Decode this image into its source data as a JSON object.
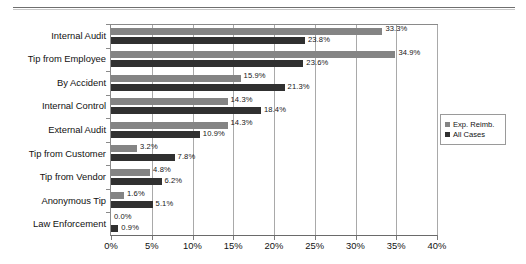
{
  "chart_data": {
    "type": "bar",
    "orientation": "horizontal",
    "title": "",
    "xlabel": "",
    "ylabel": "",
    "xlim": [
      0,
      40
    ],
    "xticks": [
      "0%",
      "5%",
      "10%",
      "15%",
      "20%",
      "25%",
      "30%",
      "35%",
      "40%"
    ],
    "xtick_values": [
      0,
      5,
      10,
      15,
      20,
      25,
      30,
      35,
      40
    ],
    "grid": true,
    "legend_position": "right",
    "categories": [
      "Internal Audit",
      "Tip from Employee",
      "By Accident",
      "Internal Control",
      "External Audit",
      "Tip from Customer",
      "Tip from Vendor",
      "Anonymous Tip",
      "Law Enforcement"
    ],
    "series": [
      {
        "name": "Exp. Reimb.",
        "color": "#848484",
        "values": [
          33.3,
          34.9,
          15.9,
          14.3,
          14.3,
          3.2,
          4.8,
          1.6,
          0.0
        ],
        "labels": [
          "33.3%",
          "34.9%",
          "15.9%",
          "14.3%",
          "14.3%",
          "3.2%",
          "4.8%",
          "1.6%",
          "0.0%"
        ]
      },
      {
        "name": "All Cases",
        "color": "#303030",
        "values": [
          23.8,
          23.6,
          21.3,
          18.4,
          10.9,
          7.8,
          6.2,
          5.1,
          0.9
        ],
        "labels": [
          "23.8%",
          "23.6%",
          "21.3%",
          "18.4%",
          "10.9%",
          "7.8%",
          "6.2%",
          "5.1%",
          "0.9%"
        ]
      }
    ]
  },
  "legend": {
    "items": [
      {
        "label": "Exp. Reimb."
      },
      {
        "label": "All Cases"
      }
    ]
  }
}
